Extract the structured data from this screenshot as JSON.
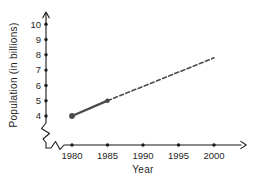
{
  "chart": {
    "ylabel": "Population (in billions)",
    "xlabel": "Year"
  },
  "chart_data": {
    "type": "line",
    "title": "",
    "xlabel": "Year",
    "ylabel": "Population (in billions)",
    "x_ticks": [
      1980,
      1985,
      1990,
      1995,
      2000
    ],
    "y_ticks": [
      4,
      5,
      6,
      7,
      8,
      9,
      10
    ],
    "xlim": [
      1980,
      2000
    ],
    "ylim": [
      4,
      10
    ],
    "grid": false,
    "legend_position": null,
    "axis_break": true,
    "axis_arrows": [
      "y-top",
      "x-right"
    ],
    "series": [
      {
        "name": "observed-population",
        "style": "solid",
        "points": [
          [
            1980,
            4
          ],
          [
            1985,
            5
          ]
        ],
        "markers": [
          [
            1980,
            4
          ],
          [
            1985,
            5
          ]
        ]
      },
      {
        "name": "projected-population",
        "style": "dashed",
        "points": [
          [
            1985,
            5
          ],
          [
            2000,
            7.8
          ]
        ],
        "markers": []
      }
    ],
    "colors": {
      "line": "#4b4b4b",
      "axis": "#1b1b1b",
      "text": "#1f1f1f",
      "background": "#ffffff"
    }
  }
}
